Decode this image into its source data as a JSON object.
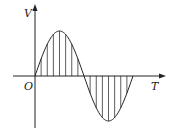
{
  "diagram": {
    "type": "sine-wave-graph",
    "labels": {
      "y_axis": "V",
      "x_axis": "T",
      "origin": "O"
    },
    "colors": {
      "stroke": "#222222",
      "background": "#ffffff"
    },
    "geometry": {
      "origin": [
        35,
        76
      ],
      "amplitude_px": 45,
      "period_px": 98,
      "x_axis_end": 165,
      "y_axis_top": 5,
      "y_axis_bottom": 128,
      "hatch_lines_per_half": 7
    }
  }
}
